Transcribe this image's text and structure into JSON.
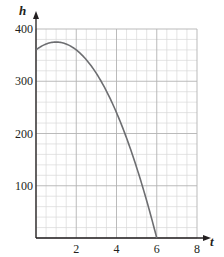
{
  "chart_data": {
    "type": "line",
    "title": "",
    "xlabel": "t",
    "ylabel": "h",
    "xlim": [
      0,
      8
    ],
    "ylim": [
      0,
      400
    ],
    "x_ticks": [
      2,
      4,
      6,
      8
    ],
    "y_ticks": [
      100,
      200,
      300,
      400
    ],
    "x_tick_labels": [
      "2",
      "4",
      "6",
      "8"
    ],
    "y_tick_labels": [
      "100",
      "200",
      "300",
      "400"
    ],
    "grid": true,
    "grid_minor_x_step": 0.5,
    "grid_minor_y_step": 20,
    "grid_major_x_step": 2,
    "grid_major_y_step": 100,
    "legend": null,
    "series": [
      {
        "name": "h(t)",
        "x": [
          0,
          0.5,
          1,
          1.5,
          2,
          2.5,
          3,
          3.5,
          4,
          4.5,
          5,
          5.5,
          6
        ],
        "y": [
          360,
          371.25,
          375,
          371.25,
          360,
          341.25,
          315,
          281.25,
          240,
          191.25,
          135,
          71.25,
          0
        ]
      }
    ]
  },
  "colors": {
    "curve": "#6d6e71",
    "axis": "#231f20",
    "grid_minor": "#d9d9d9",
    "grid_major": "#b3b3b3",
    "text": "#231f20"
  }
}
